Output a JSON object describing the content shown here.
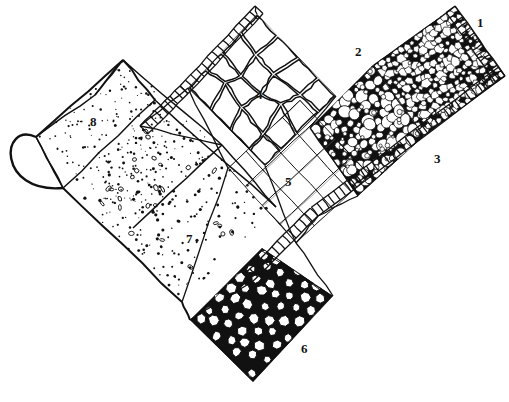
{
  "figure": {
    "kind": "line-drawing",
    "ink_color": "#111111",
    "paper_color": "#ffffff",
    "width": 509,
    "height": 402
  },
  "labels": [
    {
      "id": "1",
      "text": "1",
      "x": 477,
      "y": 16,
      "target": "crushed-stone-paving"
    },
    {
      "id": "2",
      "text": "2",
      "x": 355,
      "y": 45,
      "target": "rounded-cobble-paving"
    },
    {
      "id": "3",
      "text": "3",
      "x": 434,
      "y": 152,
      "target": "brick-edging-band"
    },
    {
      "id": "4",
      "text": "4",
      "x": 256,
      "y": 88,
      "target": "flagstone-slab-paving"
    },
    {
      "id": "5",
      "text": "5",
      "x": 285,
      "y": 175,
      "target": "square-paver-grid"
    },
    {
      "id": "6",
      "text": "6",
      "x": 301,
      "y": 342,
      "target": "sett-block-paving"
    },
    {
      "id": "7",
      "text": "7",
      "x": 186,
      "y": 232,
      "target": "coarse-gravel-surface"
    },
    {
      "id": "8",
      "text": "8",
      "x": 90,
      "y": 115,
      "target": "fine-sand-surface"
    }
  ],
  "regions": [
    {
      "id": "crushed-stone-paving",
      "label": "1",
      "texture": "angular-crushed-stone",
      "quad": [
        [
          373,
          65
        ],
        [
          455,
          6
        ],
        [
          505,
          76
        ],
        [
          424,
          136
        ]
      ],
      "stone_count": 210,
      "stone_min_r": 3.0,
      "stone_max_r": 7.5
    },
    {
      "id": "rounded-cobble-paving",
      "label": "2",
      "texture": "rounded-cobbles",
      "quad": [
        [
          310,
          128
        ],
        [
          373,
          65
        ],
        [
          424,
          136
        ],
        [
          358,
          196
        ]
      ],
      "stone_count": 120,
      "stone_min_r": 3.5,
      "stone_max_r": 11.0
    },
    {
      "id": "brick-edging-band",
      "label": "3",
      "texture": "ladder-rung-edging",
      "bands": [
        {
          "from": [
            455,
            6
          ],
          "to": [
            505,
            76
          ],
          "width": 11,
          "side": "right",
          "rungs": 13
        },
        {
          "from": [
            505,
            76
          ],
          "to": [
            318,
            216
          ],
          "width": 11,
          "side": "right",
          "rungs": 34
        },
        {
          "from": [
            318,
            216
          ],
          "to": [
            252,
            282
          ],
          "width": 11,
          "side": "right",
          "rungs": 12
        },
        {
          "from": [
            255,
            6
          ],
          "to": [
            180,
            86
          ],
          "width": 11,
          "side": "left",
          "rungs": 14
        },
        {
          "from": [
            180,
            86
          ],
          "to": [
            140,
            126
          ],
          "width": 11,
          "side": "left",
          "rungs": 8
        }
      ]
    },
    {
      "id": "flagstone-slab-paving",
      "label": "4",
      "texture": "irregular-slabs",
      "quad": [
        [
          188,
          88
        ],
        [
          257,
          14
        ],
        [
          336,
          96
        ],
        [
          265,
          166
        ]
      ],
      "rows": 4,
      "cols": 4
    },
    {
      "id": "square-paver-grid",
      "label": "5",
      "texture": "regular-square-pavers",
      "quad": [
        [
          228,
          168
        ],
        [
          300,
          100
        ],
        [
          370,
          175
        ],
        [
          296,
          243
        ]
      ],
      "rows": 4,
      "cols": 4
    },
    {
      "id": "sett-block-paving",
      "label": "6",
      "texture": "polygonal-setts",
      "quad": [
        [
          190,
          320
        ],
        [
          262,
          248
        ],
        [
          333,
          296
        ],
        [
          253,
          382
        ]
      ],
      "rows": 6,
      "cols": 6
    },
    {
      "id": "coarse-gravel-surface",
      "label": "7",
      "texture": "coarse-stipple-with-rings",
      "quad": [
        [
          63,
          188
        ],
        [
          155,
          100
        ],
        [
          276,
          207
        ],
        [
          182,
          302
        ]
      ],
      "dot_count": 190,
      "ring_count": 26
    },
    {
      "id": "fine-sand-surface",
      "label": "8",
      "texture": "fine-stipple",
      "quad": [
        [
          36,
          137
        ],
        [
          123,
          60
        ],
        [
          222,
          145
        ],
        [
          133,
          228
        ]
      ],
      "dot_count": 200
    }
  ],
  "outline": {
    "rounded_cap": {
      "description": "rounded end cap at left of surfacing strip",
      "radius": 62
    },
    "division_lines": 6
  }
}
